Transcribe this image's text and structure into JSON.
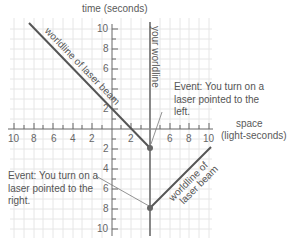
{
  "axes": {
    "time_label": "time (seconds)",
    "space_label_line1": "space",
    "space_label_line2": "(light-seconds)",
    "x_ticks_left": [
      "10",
      "8",
      "6",
      "4",
      "2"
    ],
    "x_ticks_right": [
      "2",
      "6",
      "8",
      "10"
    ],
    "y_ticks_up": [
      "10",
      "8",
      "6",
      "2"
    ],
    "y_ticks_down": [
      "2",
      "4",
      "6",
      "8",
      "10"
    ]
  },
  "labels": {
    "your_worldline": "your worldline",
    "laser_left_worldline": "worldline of laser beam",
    "laser_right_line1": "worldline of",
    "laser_right_line2": "laser beam"
  },
  "events": {
    "left": {
      "line1": "Event: You turn on a",
      "line2": "laser pointed to the",
      "line3": "left.",
      "space": 4,
      "time": -2
    },
    "right": {
      "line1": "Event: You turn on a",
      "line2": "laser pointed to the",
      "line3": "right.",
      "space": 4,
      "time": -8
    }
  },
  "colors": {
    "grid": "#e4e4e4",
    "axis": "#666666",
    "worldline": "#888888",
    "laser": "#555555",
    "event_dot": "#666666"
  }
}
